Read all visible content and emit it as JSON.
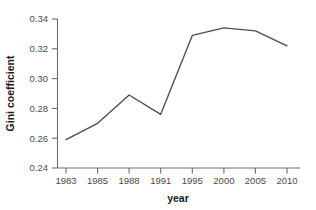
{
  "chart_data": {
    "type": "line",
    "title": "",
    "xlabel": "year",
    "ylabel": "Gini coefficient",
    "categories": [
      "1983",
      "1985",
      "1988",
      "1991",
      "1995",
      "2000",
      "2005",
      "2010"
    ],
    "values": [
      0.259,
      0.27,
      0.289,
      0.276,
      0.329,
      0.334,
      0.332,
      0.322
    ],
    "series": [
      {
        "name": "Gini coefficient",
        "values": [
          0.259,
          0.27,
          0.289,
          0.276,
          0.329,
          0.334,
          0.332,
          0.322
        ]
      }
    ],
    "ylim": [
      0.24,
      0.34
    ],
    "yticks": [
      "0.24",
      "0.26",
      "0.28",
      "0.30",
      "0.32",
      "0.34"
    ],
    "ytick_values": [
      0.24,
      0.26,
      0.28,
      0.3,
      0.32,
      0.34
    ],
    "xticks": [
      "1983",
      "1985",
      "1988",
      "1991",
      "1995",
      "2000",
      "2005",
      "2010"
    ],
    "grid": false,
    "legend": "none",
    "line_color": "#4d4d4d",
    "axis_color": "#6b6b6b",
    "background": "#ffffff",
    "x_axis_scale": "categorical"
  }
}
